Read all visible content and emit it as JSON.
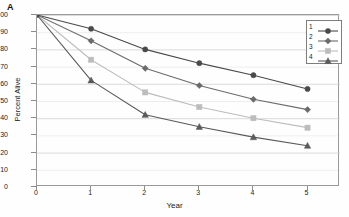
{
  "panel": {
    "label": "A"
  },
  "axes": {
    "xlabel": "Year",
    "ylabel": "Percent Alive",
    "xticks": [
      "0",
      "1",
      "2",
      "3",
      "4",
      "5"
    ],
    "yticks": [
      "0",
      "10",
      "20",
      "30",
      "40",
      "50",
      "60",
      "70",
      "80",
      "90",
      "100"
    ]
  },
  "legend": {
    "entries": [
      {
        "key": "1",
        "color": "#4a4a4a",
        "marker": "circle"
      },
      {
        "key": "2",
        "color": "#6b6b6b",
        "marker": "diamond"
      },
      {
        "key": "3",
        "color": "#bcbcbc",
        "marker": "square"
      },
      {
        "key": "4",
        "color": "#5a5a5a",
        "marker": "triangle"
      }
    ]
  },
  "colors": {
    "series1": "#4a4a4a",
    "series2": "#6b6b6b",
    "series3": "#bcbcbc",
    "series4": "#5a5a5a",
    "grid": "#cfcfcf",
    "frame": "#9a9a9a",
    "text": "#1b1b1b"
  },
  "chart_data": {
    "type": "line",
    "title": "",
    "xlabel": "Year",
    "ylabel": "Percent Alive",
    "x": [
      0,
      1,
      2,
      3,
      4,
      5
    ],
    "xlim": [
      0,
      5.6
    ],
    "ylim": [
      0,
      100
    ],
    "grid": true,
    "legend_position": "top-right",
    "series": [
      {
        "name": "1",
        "marker": "circle",
        "color": "#4a4a4a",
        "values": [
          100,
          92,
          80,
          72,
          65,
          57
        ]
      },
      {
        "name": "2",
        "marker": "diamond",
        "color": "#6b6b6b",
        "values": [
          100,
          85,
          69,
          59,
          51,
          45
        ]
      },
      {
        "name": "3",
        "marker": "square",
        "color": "#bcbcbc",
        "values": [
          100,
          74,
          55,
          46.5,
          40,
          34.5
        ]
      },
      {
        "name": "4",
        "marker": "triangle",
        "color": "#5a5a5a",
        "values": [
          100,
          62,
          42,
          35,
          29,
          24
        ]
      }
    ]
  }
}
